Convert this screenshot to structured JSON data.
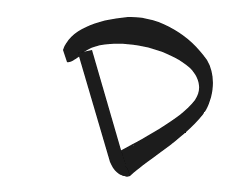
{
  "image": {
    "subject": "Brush-stroke letter D",
    "letter": "D",
    "stroke_color": "#1a1a1a",
    "background_color": "#ffffff"
  }
}
